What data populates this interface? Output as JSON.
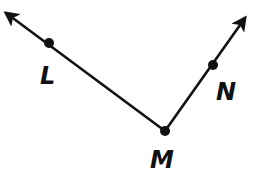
{
  "diagram": {
    "stroke_color": "#111111",
    "background": "#ffffff",
    "points": [
      {
        "id": "L",
        "label": "L",
        "x": 49,
        "y": 43,
        "label_x": 40,
        "label_y": 84
      },
      {
        "id": "M",
        "label": "M",
        "x": 165,
        "y": 131,
        "label_x": 150,
        "label_y": 168
      },
      {
        "id": "N",
        "label": "N",
        "x": 213,
        "y": 65,
        "label_x": 216,
        "label_y": 100
      }
    ],
    "rays": [
      {
        "id": "ray-ML",
        "from": "M",
        "through": "L",
        "end_x": 4,
        "end_y": 12
      },
      {
        "id": "ray-MN",
        "from": "M",
        "through": "N",
        "end_x": 247,
        "end_y": 16
      }
    ]
  }
}
